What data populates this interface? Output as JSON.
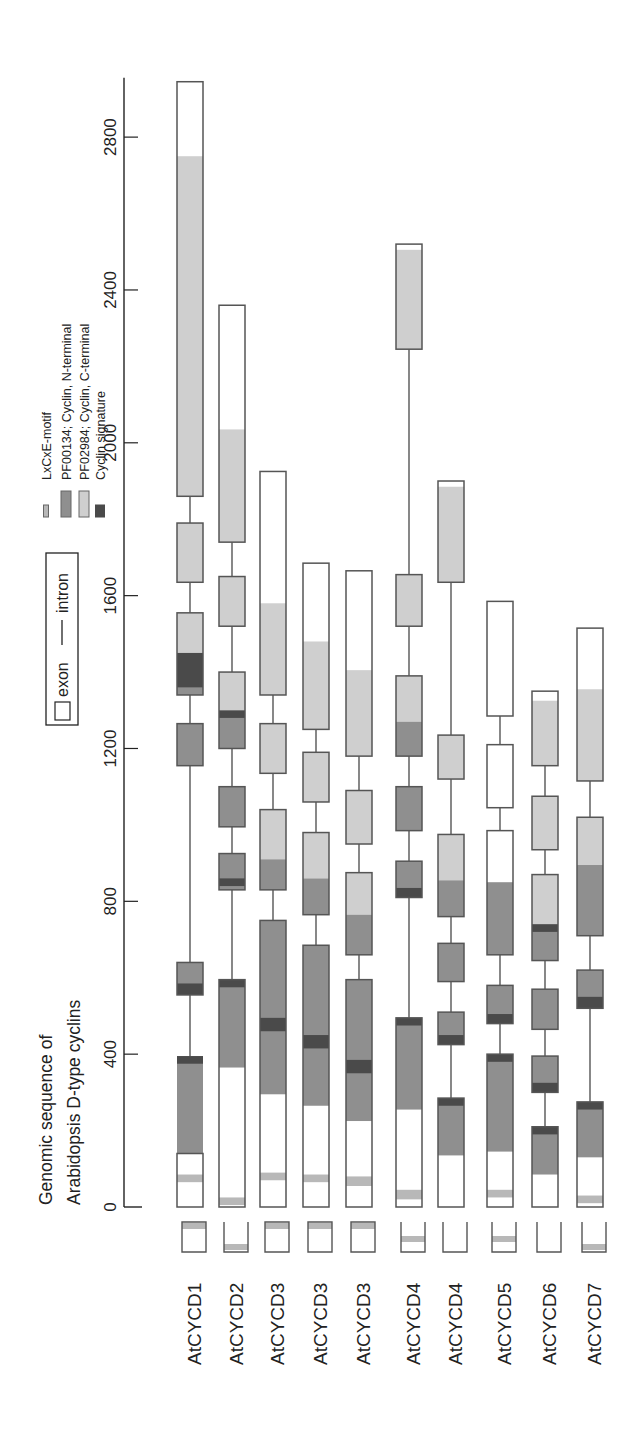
{
  "title": [
    "Genomic sequence of",
    "Arabidopsis D-type cyclins"
  ],
  "axis": {
    "ticks": [
      0,
      400,
      800,
      1200,
      1600,
      2000,
      2400,
      2800
    ],
    "min": 0,
    "max": 2950
  },
  "structure_legend": {
    "exon_label": "exon",
    "intron_label": "intron"
  },
  "domain_legend": [
    {
      "key": "lxcxe",
      "label": "LxCxE-motif",
      "color": "#b8b8b8"
    },
    {
      "key": "nterm",
      "label": "PF00134; Cyclin, N-terminal",
      "color": "#8f8f8f"
    },
    {
      "key": "cterm",
      "label": "PF02984; Cyclin, C-terminal",
      "color": "#cfcfcf"
    },
    {
      "key": "sig",
      "label": "Cyclin signature",
      "color": "#4a4a4a"
    }
  ],
  "colors": {
    "exon_fill": "#ffffff",
    "outline": "#555555",
    "axis": "#222222",
    "text": "#222222"
  },
  "genes": [
    {
      "label": "AtCYCD1",
      "exons": [
        [
          0,
          140
        ],
        [
          555,
          640
        ],
        [
          1155,
          1265
        ],
        [
          1340,
          1555
        ],
        [
          1635,
          1790
        ],
        [
          1860,
          2945
        ]
      ],
      "domains": [
        {
          "type": "lxcxe",
          "start": 65,
          "end": 85
        },
        {
          "type": "nterm",
          "start": 140,
          "end": 395
        },
        {
          "type": "sig",
          "start": 375,
          "end": 395
        },
        {
          "type": "nterm",
          "start": 555,
          "end": 640
        },
        {
          "type": "sig",
          "start": 555,
          "end": 585
        },
        {
          "type": "nterm",
          "start": 1155,
          "end": 1265
        },
        {
          "type": "nterm",
          "start": 1340,
          "end": 1450
        },
        {
          "type": "sig",
          "start": 1360,
          "end": 1450
        },
        {
          "type": "cterm",
          "start": 1450,
          "end": 1555
        },
        {
          "type": "cterm",
          "start": 1635,
          "end": 1790
        },
        {
          "type": "cterm",
          "start": 1860,
          "end": 2750
        }
      ],
      "mini": {
        "lxcxe_pos": "top"
      }
    },
    {
      "label": "AtCYCD2",
      "exons": [
        [
          0,
          595
        ],
        [
          830,
          925
        ],
        [
          995,
          1100
        ],
        [
          1200,
          1400
        ],
        [
          1520,
          1650
        ],
        [
          1740,
          2360
        ]
      ],
      "domains": [
        {
          "type": "lxcxe",
          "start": 5,
          "end": 25
        },
        {
          "type": "nterm",
          "start": 365,
          "end": 595
        },
        {
          "type": "sig",
          "start": 575,
          "end": 595
        },
        {
          "type": "nterm",
          "start": 830,
          "end": 925
        },
        {
          "type": "sig",
          "start": 840,
          "end": 860
        },
        {
          "type": "nterm",
          "start": 995,
          "end": 1100
        },
        {
          "type": "nterm",
          "start": 1200,
          "end": 1290
        },
        {
          "type": "sig",
          "start": 1280,
          "end": 1300
        },
        {
          "type": "cterm",
          "start": 1300,
          "end": 1400
        },
        {
          "type": "cterm",
          "start": 1520,
          "end": 1650
        },
        {
          "type": "cterm",
          "start": 1740,
          "end": 2035
        }
      ],
      "mini": {
        "lxcxe_pos": "bottom"
      }
    },
    {
      "label": "AtCYCD3",
      "exons": [
        [
          0,
          750
        ],
        [
          830,
          1040
        ],
        [
          1135,
          1265
        ],
        [
          1340,
          1925
        ]
      ],
      "domains": [
        {
          "type": "lxcxe",
          "start": 70,
          "end": 90
        },
        {
          "type": "nterm",
          "start": 295,
          "end": 750
        },
        {
          "type": "sig",
          "start": 460,
          "end": 495
        },
        {
          "type": "nterm",
          "start": 830,
          "end": 910
        },
        {
          "type": "cterm",
          "start": 910,
          "end": 1040
        },
        {
          "type": "cterm",
          "start": 1135,
          "end": 1265
        },
        {
          "type": "cterm",
          "start": 1340,
          "end": 1580
        }
      ],
      "mini": {
        "lxcxe_pos": "top"
      }
    },
    {
      "label": "AtCYCD3",
      "exons": [
        [
          0,
          685
        ],
        [
          765,
          980
        ],
        [
          1060,
          1190
        ],
        [
          1250,
          1685
        ]
      ],
      "domains": [
        {
          "type": "lxcxe",
          "start": 65,
          "end": 85
        },
        {
          "type": "nterm",
          "start": 265,
          "end": 685
        },
        {
          "type": "sig",
          "start": 415,
          "end": 450
        },
        {
          "type": "nterm",
          "start": 765,
          "end": 860
        },
        {
          "type": "cterm",
          "start": 860,
          "end": 980
        },
        {
          "type": "cterm",
          "start": 1060,
          "end": 1190
        },
        {
          "type": "cterm",
          "start": 1250,
          "end": 1480
        }
      ],
      "mini": {
        "lxcxe_pos": "top"
      }
    },
    {
      "label": "AtCYCD3",
      "exons": [
        [
          0,
          595
        ],
        [
          660,
          875
        ],
        [
          950,
          1090
        ],
        [
          1180,
          1665
        ]
      ],
      "domains": [
        {
          "type": "lxcxe",
          "start": 55,
          "end": 80
        },
        {
          "type": "nterm",
          "start": 225,
          "end": 595
        },
        {
          "type": "sig",
          "start": 350,
          "end": 385
        },
        {
          "type": "nterm",
          "start": 660,
          "end": 765
        },
        {
          "type": "cterm",
          "start": 765,
          "end": 875
        },
        {
          "type": "cterm",
          "start": 950,
          "end": 1090
        },
        {
          "type": "cterm",
          "start": 1180,
          "end": 1405
        }
      ],
      "mini": {
        "lxcxe_pos": "top"
      }
    },
    {
      "label": "AtCYCD4",
      "exons": [
        [
          0,
          495
        ],
        [
          810,
          905
        ],
        [
          985,
          1100
        ],
        [
          1180,
          1390
        ],
        [
          1520,
          1655
        ],
        [
          2245,
          2520
        ]
      ],
      "domains": [
        {
          "type": "lxcxe",
          "start": 20,
          "end": 45
        },
        {
          "type": "nterm",
          "start": 255,
          "end": 495
        },
        {
          "type": "sig",
          "start": 475,
          "end": 495
        },
        {
          "type": "nterm",
          "start": 810,
          "end": 905
        },
        {
          "type": "sig",
          "start": 810,
          "end": 835
        },
        {
          "type": "nterm",
          "start": 985,
          "end": 1100
        },
        {
          "type": "nterm",
          "start": 1180,
          "end": 1270
        },
        {
          "type": "cterm",
          "start": 1270,
          "end": 1390
        },
        {
          "type": "cterm",
          "start": 1520,
          "end": 1655
        },
        {
          "type": "cterm",
          "start": 2245,
          "end": 2505
        }
      ],
      "mini": {
        "lxcxe_pos": "mid"
      }
    },
    {
      "label": "AtCYCD4",
      "exons": [
        [
          0,
          285
        ],
        [
          425,
          510
        ],
        [
          590,
          690
        ],
        [
          760,
          975
        ],
        [
          1120,
          1235
        ],
        [
          1635,
          1900
        ]
      ],
      "domains": [
        {
          "type": "nterm",
          "start": 135,
          "end": 285
        },
        {
          "type": "sig",
          "start": 265,
          "end": 285
        },
        {
          "type": "nterm",
          "start": 425,
          "end": 510
        },
        {
          "type": "sig",
          "start": 425,
          "end": 450
        },
        {
          "type": "nterm",
          "start": 590,
          "end": 690
        },
        {
          "type": "nterm",
          "start": 760,
          "end": 855
        },
        {
          "type": "cterm",
          "start": 855,
          "end": 975
        },
        {
          "type": "cterm",
          "start": 1120,
          "end": 1235
        },
        {
          "type": "cterm",
          "start": 1635,
          "end": 1885
        }
      ],
      "mini": {
        "lxcxe_pos": "none"
      }
    },
    {
      "label": "AtCYCD5",
      "exons": [
        [
          0,
          400
        ],
        [
          480,
          580
        ],
        [
          660,
          985
        ],
        [
          1045,
          1210
        ],
        [
          1285,
          1585
        ]
      ],
      "domains": [
        {
          "type": "lxcxe",
          "start": 25,
          "end": 45
        },
        {
          "type": "nterm",
          "start": 145,
          "end": 400
        },
        {
          "type": "sig",
          "start": 380,
          "end": 400
        },
        {
          "type": "nterm",
          "start": 480,
          "end": 580
        },
        {
          "type": "sig",
          "start": 480,
          "end": 505
        },
        {
          "type": "nterm",
          "start": 660,
          "end": 850
        }
      ],
      "mini": {
        "lxcxe_pos": "mid"
      }
    },
    {
      "label": "AtCYCD6",
      "exons": [
        [
          0,
          210
        ],
        [
          300,
          395
        ],
        [
          465,
          570
        ],
        [
          645,
          870
        ],
        [
          935,
          1075
        ],
        [
          1155,
          1350
        ]
      ],
      "domains": [
        {
          "type": "nterm",
          "start": 85,
          "end": 210
        },
        {
          "type": "sig",
          "start": 190,
          "end": 210
        },
        {
          "type": "nterm",
          "start": 300,
          "end": 395
        },
        {
          "type": "sig",
          "start": 300,
          "end": 325
        },
        {
          "type": "nterm",
          "start": 465,
          "end": 570
        },
        {
          "type": "nterm",
          "start": 645,
          "end": 740
        },
        {
          "type": "sig",
          "start": 720,
          "end": 740
        },
        {
          "type": "cterm",
          "start": 740,
          "end": 870
        },
        {
          "type": "cterm",
          "start": 935,
          "end": 1075
        },
        {
          "type": "cterm",
          "start": 1155,
          "end": 1325
        }
      ],
      "mini": {
        "lxcxe_pos": "none"
      }
    },
    {
      "label": "AtCYCD7",
      "exons": [
        [
          0,
          275
        ],
        [
          520,
          620
        ],
        [
          710,
          1020
        ],
        [
          1115,
          1515
        ]
      ],
      "domains": [
        {
          "type": "lxcxe",
          "start": 10,
          "end": 30
        },
        {
          "type": "nterm",
          "start": 130,
          "end": 275
        },
        {
          "type": "sig",
          "start": 255,
          "end": 275
        },
        {
          "type": "nterm",
          "start": 520,
          "end": 620
        },
        {
          "type": "sig",
          "start": 520,
          "end": 550
        },
        {
          "type": "nterm",
          "start": 710,
          "end": 895
        },
        {
          "type": "cterm",
          "start": 895,
          "end": 1020
        },
        {
          "type": "cterm",
          "start": 1115,
          "end": 1355
        }
      ],
      "mini": {
        "lxcxe_pos": "bottom"
      }
    }
  ]
}
